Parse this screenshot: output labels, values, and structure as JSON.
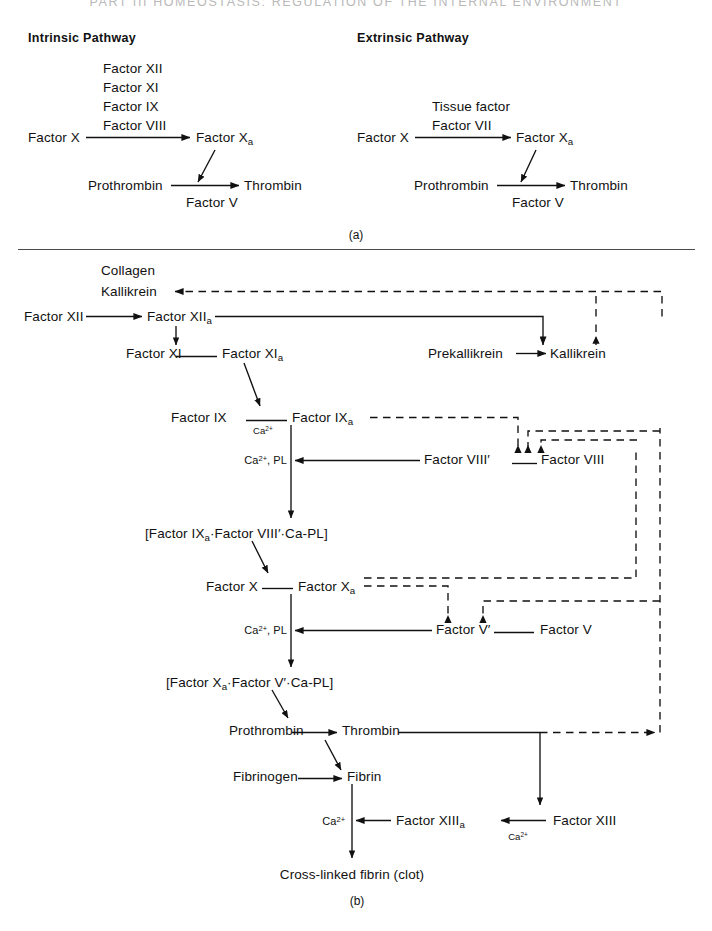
{
  "running_head": "PART III  HOMEOSTASIS: REGULATION OF THE INTERNAL ENVIRONMENT",
  "figure": {
    "part_a_label": "(a)",
    "part_b_label": "(b)"
  },
  "panel_a": {
    "intrinsic": {
      "heading": "Intrinsic Pathway",
      "cofactors": [
        "Factor XII",
        "Factor XI",
        "Factor IX",
        "Factor VIII"
      ],
      "substrate": "Factor X",
      "product": "Factor X",
      "product_sub": "a",
      "prothrombin": "Prothrombin",
      "thrombin": "Thrombin",
      "cofactor_v": "Factor V"
    },
    "extrinsic": {
      "heading": "Extrinsic Pathway",
      "cofactors": [
        "Tissue factor",
        "Factor VII"
      ],
      "substrate": "Factor X",
      "product": "Factor X",
      "product_sub": "a",
      "prothrombin": "Prothrombin",
      "thrombin": "Thrombin",
      "cofactor_v": "Factor V"
    }
  },
  "panel_b": {
    "nodes": {
      "collagen": "Collagen",
      "kallikrein_activator": "Kallikrein",
      "factor_xii": "Factor XII",
      "factor_xiia": "Factor XII",
      "factor_xiia_sub": "a",
      "factor_xi": "Factor XI",
      "factor_xia": "Factor XI",
      "factor_xia_sub": "a",
      "prekallikrein": "Prekallikrein",
      "kallikrein": "Kallikrein",
      "factor_ix": "Factor IX",
      "factor_ixa": "Factor IX",
      "factor_ixa_sub": "a",
      "ca_label_ix": "Ca",
      "ca_label_ix_sup": "2+",
      "ca_pl_ix": "Ca",
      "ca_pl_ix_sup": "2+",
      "ca_pl_ix_tail": ", PL",
      "factor_viii_prime": "Factor VIII′",
      "factor_viii": "Factor VIII",
      "complex_ix": "[Factor IX",
      "complex_ix_sub": "a",
      "complex_ix_tail": "·Factor VIII′·Ca-PL]",
      "factor_x": "Factor X",
      "factor_xa": "Factor X",
      "factor_xa_sub": "a",
      "ca_pl_x": "Ca",
      "ca_pl_x_sup": "2+",
      "ca_pl_x_tail": ", PL",
      "factor_v_prime": "Factor V′",
      "factor_v": "Factor V",
      "complex_x": "[Factor X",
      "complex_x_sub": "a",
      "complex_x_tail": "·Factor V′·Ca-PL]",
      "prothrombin": "Prothrombin",
      "thrombin": "Thrombin",
      "fibrinogen": "Fibrinogen",
      "fibrin": "Fibrin",
      "ca_fibrin": "Ca",
      "ca_fibrin_sup": "2+",
      "factor_xiiia": "Factor XIII",
      "factor_xiiia_sub": "a",
      "factor_xiii": "Factor XIII",
      "ca_xiii": "Ca",
      "ca_xiii_sup": "2+",
      "cross_linked": "Cross-linked fibrin (clot)"
    }
  },
  "colors": {
    "ink": "#111111",
    "rule": "#4a4a4a",
    "runhead": "#b9b9b9",
    "page": "#ffffff"
  }
}
